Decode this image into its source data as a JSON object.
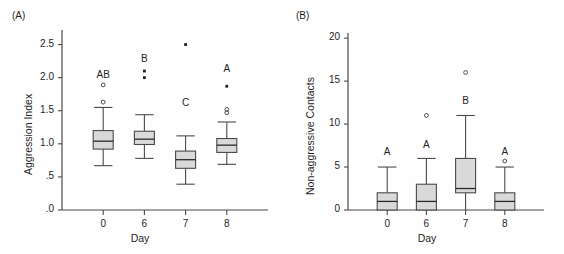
{
  "figure": {
    "width": 564,
    "height": 254,
    "background": "#fefefe",
    "line_color": "#4a4a4a",
    "box_fill": "#d9d9d9",
    "box_stroke": "#4a4a4a"
  },
  "panels": [
    {
      "id": "A",
      "label": "(A)",
      "chart_data": {
        "type": "box",
        "title": "",
        "xlabel": "Day",
        "ylabel": "Aggression Index",
        "categories": [
          "0",
          "6",
          "7",
          "8"
        ],
        "ytick_labels": [
          ".0",
          ".5",
          "1.0",
          "1.5",
          "2.0",
          "2.5"
        ],
        "ytick_values": [
          0.0,
          0.5,
          1.0,
          1.5,
          2.0,
          2.5
        ],
        "ylim": [
          0.0,
          2.72
        ],
        "grid": false,
        "legend": "none",
        "annotations": [
          "AB",
          "B",
          "C",
          "A"
        ],
        "boxes": [
          {
            "category": "0",
            "letter": "AB",
            "letter_value": 2.03,
            "whisker_low": 0.67,
            "q1": 0.92,
            "median": 1.04,
            "q3": 1.2,
            "whisker_high": 1.55,
            "outliers": [
              1.63,
              1.89
            ],
            "outlier_style": [
              "circle",
              "circle"
            ]
          },
          {
            "category": "6",
            "letter": "B",
            "letter_value": 2.26,
            "whisker_low": 0.78,
            "q1": 0.99,
            "median": 1.07,
            "q3": 1.19,
            "whisker_high": 1.44,
            "outliers": [
              2.0,
              2.1
            ],
            "outlier_style": [
              "dot",
              "dot"
            ]
          },
          {
            "category": "7",
            "letter": "C",
            "letter_value": 1.6,
            "whisker_low": 0.39,
            "q1": 0.63,
            "median": 0.76,
            "q3": 0.89,
            "whisker_high": 1.12,
            "outliers": [
              2.5
            ],
            "outlier_style": [
              "dot"
            ]
          },
          {
            "category": "8",
            "letter": "A",
            "letter_value": 2.12,
            "whisker_low": 0.69,
            "q1": 0.87,
            "median": 0.98,
            "q3": 1.08,
            "whisker_high": 1.33,
            "outliers": [
              1.47,
              1.52,
              1.87
            ],
            "outlier_style": [
              "circle",
              "circle",
              "dot"
            ]
          }
        ]
      }
    },
    {
      "id": "B",
      "label": "(B)",
      "chart_data": {
        "type": "box",
        "title": "",
        "xlabel": "Day",
        "ylabel": "Non-aggressive Contacts",
        "categories": [
          "0",
          "6",
          "7",
          "8"
        ],
        "ytick_labels": [
          "0",
          "5",
          "10",
          "15",
          "20"
        ],
        "ytick_values": [
          0,
          5,
          10,
          15,
          20
        ],
        "ylim": [
          0,
          20.6
        ],
        "grid": false,
        "legend": "none",
        "annotations": [
          "A",
          "A",
          "B",
          "A"
        ],
        "boxes": [
          {
            "category": "0",
            "letter": "A",
            "letter_value": 6.6,
            "whisker_low": 0,
            "q1": 0,
            "median": 1,
            "q3": 2,
            "whisker_high": 5,
            "outliers": [],
            "outlier_style": []
          },
          {
            "category": "6",
            "letter": "A",
            "letter_value": 7.4,
            "whisker_low": 0,
            "q1": 0,
            "median": 1,
            "q3": 3,
            "whisker_high": 6,
            "outliers": [
              11
            ],
            "outlier_style": [
              "circle"
            ]
          },
          {
            "category": "7",
            "letter": "B",
            "letter_value": 12.6,
            "whisker_low": 0,
            "q1": 2,
            "median": 2.5,
            "q3": 6,
            "whisker_high": 11,
            "outliers": [
              16
            ],
            "outlier_style": [
              "circle"
            ]
          },
          {
            "category": "8",
            "letter": "A",
            "letter_value": 6.6,
            "whisker_low": 0,
            "q1": 0,
            "median": 1,
            "q3": 2,
            "whisker_high": 5,
            "outliers": [
              5.7
            ],
            "outlier_style": [
              "circle"
            ]
          }
        ]
      }
    }
  ]
}
